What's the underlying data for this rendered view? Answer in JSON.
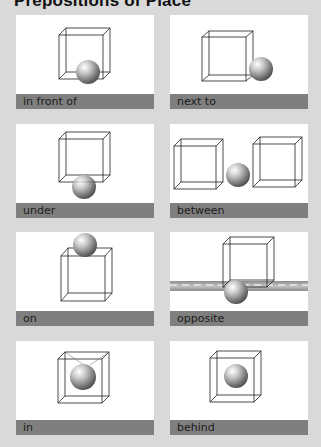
{
  "page": {
    "title": "Prepositions of Place"
  },
  "cards": [
    {
      "label": "in front of",
      "icon": "cube-with-sphere-in-front-icon"
    },
    {
      "label": "next to",
      "icon": "cube-with-sphere-next-to-icon"
    },
    {
      "label": "under",
      "icon": "cube-with-sphere-under-icon"
    },
    {
      "label": "between",
      "icon": "sphere-between-cubes-icon"
    },
    {
      "label": "on",
      "icon": "sphere-on-cube-icon"
    },
    {
      "label": "opposite",
      "icon": "sphere-opposite-cube-road-icon"
    },
    {
      "label": "in",
      "icon": "sphere-in-cube-icon"
    },
    {
      "label": "behind",
      "icon": "sphere-behind-cube-icon"
    }
  ],
  "colors": {
    "background": "#d9d9d9",
    "card": "#ffffff",
    "label_bar": "#7f7f7f",
    "road": "#a8a8a8"
  }
}
